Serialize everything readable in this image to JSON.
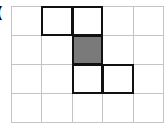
{
  "label": "(",
  "grid": {
    "columns": 5,
    "rows": 4,
    "cell_width": 30.4,
    "cell_height": 29,
    "line_color": "#c4c4c4",
    "bold_color": "#111111",
    "fill_color": "#7a7a7a",
    "highlighted_cells": [
      {
        "row": 0,
        "col": 1,
        "filled": false
      },
      {
        "row": 0,
        "col": 2,
        "filled": false
      },
      {
        "row": 1,
        "col": 2,
        "filled": true
      },
      {
        "row": 2,
        "col": 2,
        "filled": false
      },
      {
        "row": 2,
        "col": 3,
        "filled": false
      }
    ]
  }
}
